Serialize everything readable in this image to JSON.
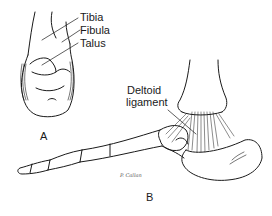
{
  "figure": {
    "panel_a": {
      "letter": "A",
      "labels": [
        "Tibia",
        "Fibula",
        "Talus"
      ]
    },
    "panel_b": {
      "letter": "B",
      "label_line1": "Deltoid",
      "label_line2": "ligament"
    },
    "signature": "P. Callan"
  }
}
